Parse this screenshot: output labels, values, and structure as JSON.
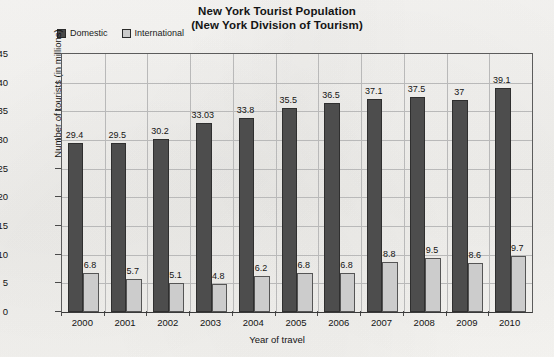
{
  "title": {
    "line1": "New York Tourist Population",
    "line2": "(New York Division of Tourism)"
  },
  "legend": {
    "items": [
      {
        "label": "Domestic",
        "color": "#4a4a4a"
      },
      {
        "label": "International",
        "color": "#cbcbcb"
      }
    ]
  },
  "axes": {
    "x_title": "Year of travel",
    "y_title": "Number of tourists (in millions)",
    "y_ticks": [
      "0",
      "5",
      "10",
      "15",
      "20",
      "25",
      "30",
      "35",
      "40",
      "45"
    ]
  },
  "chart_data": {
    "type": "bar",
    "title": "New York Tourist Population (New York Division of Tourism)",
    "xlabel": "Year of travel",
    "ylabel": "Number of tourists (in millions)",
    "ylim": [
      0,
      45
    ],
    "ytick_step": 5,
    "grid": true,
    "legend_position": "top-left",
    "categories": [
      "2000",
      "2001",
      "2002",
      "2003",
      "2004",
      "2005",
      "2006",
      "2007",
      "2008",
      "2009",
      "2010"
    ],
    "series": [
      {
        "name": "Domestic",
        "color": "#4a4a4a",
        "values": [
          29.4,
          29.5,
          30.2,
          33.03,
          33.8,
          35.5,
          36.5,
          37.1,
          37.5,
          37,
          39.1
        ],
        "labels": [
          "29.4",
          "29.5",
          "30.2",
          "33.03",
          "33.8",
          "35.5",
          "36.5",
          "37.1",
          "37.5",
          "37",
          "39.1"
        ]
      },
      {
        "name": "International",
        "color": "#cbcbcb",
        "values": [
          6.8,
          5.7,
          5.1,
          4.8,
          6.2,
          6.8,
          6.8,
          8.8,
          9.5,
          8.6,
          9.7
        ],
        "labels": [
          "6.8",
          "5.7",
          "5.1",
          "4.8",
          "6.2",
          "6.8",
          "6.8",
          "8.8",
          "9.5",
          "8.6",
          "9.7"
        ]
      }
    ]
  }
}
